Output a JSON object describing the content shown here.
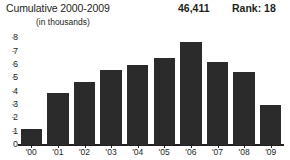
{
  "header": {
    "title": "Cumulative 2000-2009",
    "total_value": "46,411",
    "rank_label": "Rank: 18",
    "subtitle": "(in thousands)"
  },
  "colors": {
    "bar": "#2b2b2b",
    "axis": "#231f20",
    "text": "#231f20",
    "tick_dash": "#a8a8a8",
    "background": "#ffffff"
  },
  "chart_data": {
    "type": "bar",
    "title": "Cumulative 2000-2009",
    "subtitle": "(in thousands)",
    "xlabel": "",
    "ylabel": "",
    "ylim": [
      0,
      8
    ],
    "yticks": [
      0,
      1,
      2,
      3,
      4,
      5,
      6,
      7,
      8
    ],
    "ytick_labels": [
      "0",
      "1",
      "2",
      "3",
      "4",
      "5",
      "6",
      "7",
      "8"
    ],
    "grid": false,
    "legend": "none",
    "categories": [
      "'00",
      "'01",
      "'02",
      "'03",
      "'04",
      "'05",
      "'06",
      "'07",
      "'08",
      "'09"
    ],
    "values": [
      1.2,
      3.9,
      4.7,
      5.6,
      6.0,
      6.5,
      7.7,
      6.2,
      5.5,
      3.0
    ],
    "annotations": {
      "total": "46,411",
      "rank": "Rank: 18"
    }
  }
}
